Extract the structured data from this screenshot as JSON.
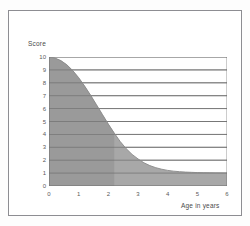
{
  "figure": {
    "y_axis_title": "Score",
    "x_axis_title": "Age in years",
    "border_color": "#8d8d92",
    "fill_color": "#a8a8a8",
    "fill_color_dark": "#9a9a9a",
    "grid_color": "#6f6f6f",
    "axis_color": "#6f6f6f",
    "text_color": "#4a4a4a"
  },
  "chart_data": {
    "type": "area",
    "title": "",
    "subtitle": "",
    "xlabel": "Age in years",
    "ylabel": "Score",
    "xlim": [
      0,
      6
    ],
    "ylim": [
      0,
      10
    ],
    "grid": true,
    "legend": null,
    "x_ticks": [
      "0",
      "1",
      "2",
      "3",
      "4",
      "5",
      "6"
    ],
    "y_ticks": [
      "0",
      "1",
      "2",
      "3",
      "4",
      "5",
      "6",
      "7",
      "8",
      "9",
      "10"
    ],
    "x_tick_values": [
      0,
      1,
      2,
      3,
      4,
      5,
      6
    ],
    "y_tick_values": [
      0,
      1,
      2,
      3,
      4,
      5,
      6,
      7,
      8,
      9,
      10
    ],
    "series": [
      {
        "name": "Score",
        "x": [
          0,
          0.2,
          0.4,
          0.6,
          0.8,
          1.0,
          1.2,
          1.4,
          1.6,
          1.8,
          2.0,
          2.2,
          2.4,
          2.6,
          2.8,
          3.0,
          3.2,
          3.4,
          3.6,
          3.8,
          4.0,
          4.2,
          4.4,
          4.6,
          4.8,
          5.0,
          5.2,
          5.4,
          5.6,
          5.8,
          6.0
        ],
        "values": [
          10.0,
          9.92,
          9.72,
          9.4,
          8.95,
          8.4,
          7.75,
          7.05,
          6.3,
          5.55,
          4.8,
          4.1,
          3.45,
          2.9,
          2.45,
          2.1,
          1.8,
          1.58,
          1.42,
          1.3,
          1.21,
          1.15,
          1.11,
          1.08,
          1.06,
          1.04,
          1.03,
          1.02,
          1.015,
          1.01,
          1.0
        ]
      }
    ],
    "shaded_band": {
      "x_start": 0,
      "x_end": 2.2,
      "note": "darker shading from age 0 to about 2.2"
    },
    "baseline": 0
  }
}
